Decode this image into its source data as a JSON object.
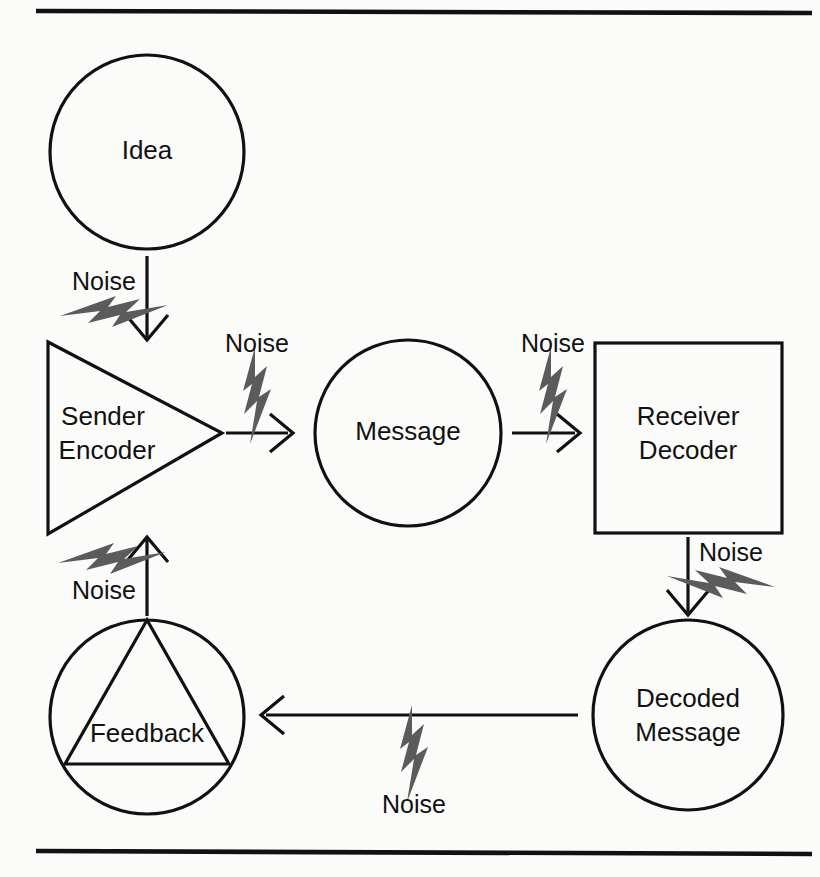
{
  "diagram": {
    "type": "process-flow",
    "background_color": "#fbfbfa",
    "stroke_color": "#111111",
    "bolt_color": "#5b5b5b",
    "rules": {
      "top_rule": "horizontal-rule",
      "bottom_rule": "horizontal-rule"
    },
    "nodes": [
      {
        "id": "idea",
        "label": "Idea",
        "shape": "circle",
        "cx": 147,
        "cy": 152,
        "r": 97
      },
      {
        "id": "sender",
        "label_line1": "Sender",
        "label_line2": "Encoder",
        "shape": "triangle-right",
        "x1": 48,
        "y1": 342,
        "x2": 48,
        "y2": 534,
        "x3": 222,
        "y3": 433
      },
      {
        "id": "message",
        "label": "Message",
        "shape": "circle",
        "cx": 408,
        "cy": 433,
        "r": 93
      },
      {
        "id": "receiver",
        "label_line1": "Receiver",
        "label_line2": "Decoder",
        "shape": "rectangle",
        "x": 595,
        "y": 343,
        "width": 187,
        "height": 190
      },
      {
        "id": "decoded",
        "label_line1": "Decoded",
        "label_line2": "Message",
        "shape": "circle",
        "cx": 688,
        "cy": 715,
        "r": 95
      },
      {
        "id": "feedback",
        "label": "Feedback",
        "shape": "circle-with-triangle",
        "cx": 147,
        "cy": 717,
        "r": 97
      }
    ],
    "connectors": [
      {
        "id": "idea-to-sender",
        "from": "idea",
        "to": "sender",
        "direction": "down",
        "noise_label": "Noise",
        "bolt": "up-left"
      },
      {
        "id": "sender-to-message",
        "from": "sender",
        "to": "message",
        "direction": "right",
        "noise_label": "Noise",
        "bolt": "up"
      },
      {
        "id": "message-to-receiver",
        "from": "message",
        "to": "receiver",
        "direction": "right",
        "noise_label": "Noise",
        "bolt": "up"
      },
      {
        "id": "receiver-to-decoded",
        "from": "receiver",
        "to": "decoded",
        "direction": "down",
        "noise_label": "Noise",
        "bolt": "up-right"
      },
      {
        "id": "decoded-to-feedback",
        "from": "decoded",
        "to": "feedback",
        "direction": "left",
        "noise_label": "Noise",
        "bolt": "down"
      },
      {
        "id": "feedback-to-sender",
        "from": "feedback",
        "to": "sender",
        "direction": "up",
        "noise_label": "Noise",
        "bolt": "up-left"
      }
    ],
    "labels": {
      "idea": "Idea",
      "sender_line1": "Sender",
      "sender_line2": "Encoder",
      "message": "Message",
      "receiver_line1": "Receiver",
      "receiver_line2": "Decoder",
      "decoded_line1": "Decoded",
      "decoded_line2": "Message",
      "feedback": "Feedback",
      "noise_1": "Noise",
      "noise_2": "Noise",
      "noise_3": "Noise",
      "noise_4": "Noise",
      "noise_5": "Noise",
      "noise_6": "Noise"
    }
  }
}
